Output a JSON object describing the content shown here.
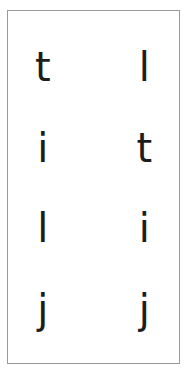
{
  "panel": {
    "border_color": "#9a9a9a",
    "background_color": "#ffffff",
    "glyph_color": "#1c1c1c"
  },
  "grid": {
    "columns": 2,
    "rows": [
      {
        "left": "t",
        "right": "l"
      },
      {
        "left": "i",
        "right": "t"
      },
      {
        "left": "l",
        "right": "j"
      },
      {
        "left": "j",
        "right": "j"
      }
    ]
  },
  "letters": {
    "left_column": [
      "t",
      "i",
      "l",
      "j"
    ],
    "right_column": [
      "l",
      "t",
      "i",
      "j"
    ]
  }
}
